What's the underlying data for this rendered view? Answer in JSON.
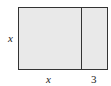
{
  "diagram": {
    "type": "area-model-rectangle",
    "fill_color": "#e9e9e9",
    "stroke_color": "#333333",
    "regions": [
      {
        "name": "square",
        "width_label": "x",
        "height_label": "x"
      },
      {
        "name": "strip",
        "width_label": "3",
        "height_label": "x"
      }
    ],
    "labels": {
      "left_side": "x",
      "bottom_left": "x",
      "bottom_right": "3"
    }
  }
}
